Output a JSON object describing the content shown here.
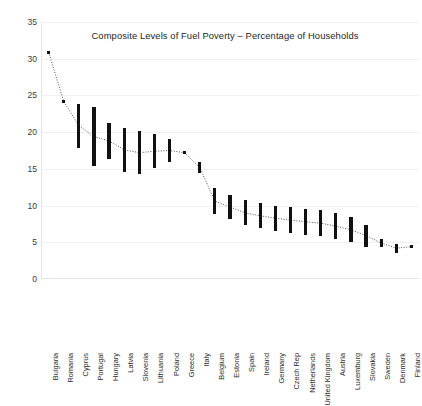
{
  "chart_data": {
    "type": "bar",
    "subtype": "high-low range bars with dotted mid-point line",
    "title": "Composite Levels of Fuel Poverty – Percentage of Households",
    "xlabel": "",
    "ylabel": "",
    "ylim": [
      0,
      35
    ],
    "ytick_labels": [
      "0",
      "5",
      "10",
      "15",
      "20",
      "25",
      "30",
      "35"
    ],
    "ytick_values": [
      0,
      5,
      10,
      15,
      20,
      25,
      30,
      35
    ],
    "grid": true,
    "legend": "none",
    "bar_color": "#111111",
    "line_color": "#555555",
    "line_style": "dotted",
    "categories": [
      "Bulgaria",
      "Romania",
      "Cyprus",
      "Portugal",
      "Hungary",
      "Latvia",
      "Slovenia",
      "Lithuania",
      "Poland",
      "Greece",
      "Italy",
      "Belgium",
      "Estonia",
      "Spain",
      "Ireland",
      "Germany",
      "Czech Rep",
      "Netherlands",
      "United Kingdom",
      "Austria",
      "Luxemburg",
      "Slovakia",
      "Sweden",
      "Denmark",
      "Finland"
    ],
    "series": [
      {
        "name": "Range high",
        "values": [
          31.0,
          24.3,
          23.8,
          23.4,
          21.2,
          20.5,
          20.1,
          19.7,
          19.0,
          17.4,
          16.0,
          12.4,
          11.4,
          10.7,
          10.3,
          10.0,
          9.8,
          9.6,
          9.4,
          9.0,
          8.4,
          7.3,
          5.4,
          4.8,
          4.6
        ]
      },
      {
        "name": "Range low",
        "values": [
          30.7,
          24.1,
          17.9,
          15.4,
          16.4,
          14.6,
          14.3,
          15.1,
          15.9,
          17.0,
          14.4,
          8.8,
          8.2,
          7.3,
          6.9,
          6.5,
          6.2,
          6.0,
          5.8,
          5.4,
          5.0,
          4.4,
          4.4,
          3.5,
          4.2
        ]
      },
      {
        "name": "Mid point",
        "values": [
          30.9,
          24.2,
          20.9,
          19.4,
          18.8,
          17.6,
          17.2,
          17.4,
          17.5,
          17.2,
          15.2,
          10.6,
          9.8,
          9.0,
          8.6,
          8.3,
          8.0,
          7.8,
          7.6,
          7.2,
          6.7,
          5.9,
          4.9,
          4.2,
          4.4
        ]
      }
    ]
  }
}
